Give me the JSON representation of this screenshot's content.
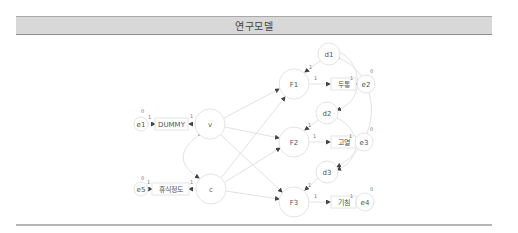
{
  "header": {
    "title": "연구모델"
  },
  "diagram": {
    "latent_nodes": [
      {
        "id": "v",
        "label": "v"
      },
      {
        "id": "c",
        "label": "c"
      },
      {
        "id": "F1",
        "label": "F1"
      },
      {
        "id": "F2",
        "label": "F2"
      },
      {
        "id": "F3",
        "label": "F3"
      }
    ],
    "disturbance_nodes": [
      {
        "id": "d1",
        "label": "d1"
      },
      {
        "id": "d2",
        "label": "d2"
      },
      {
        "id": "d3",
        "label": "d3"
      }
    ],
    "error_nodes": [
      {
        "id": "e1",
        "label": "e1",
        "variance": "0",
        "path_weight": "1"
      },
      {
        "id": "e5",
        "label": "e5",
        "variance": "0",
        "path_weight": "1"
      },
      {
        "id": "e2",
        "label": "e2",
        "variance": "0",
        "path_weight": "1"
      },
      {
        "id": "e3",
        "label": "e3",
        "variance": "0",
        "path_weight": "1"
      },
      {
        "id": "e4",
        "label": "e4",
        "variance": "0",
        "path_weight": "1"
      }
    ],
    "observed_nodes": [
      {
        "id": "dummy",
        "label": "DUMMY",
        "loading": "1"
      },
      {
        "id": "rest",
        "label": "휴식정도",
        "loading": "1"
      },
      {
        "id": "headache",
        "label": "두통",
        "loading": "1"
      },
      {
        "id": "fever",
        "label": "고열",
        "loading": "1"
      },
      {
        "id": "cough",
        "label": "기침",
        "loading": "1"
      }
    ],
    "disturbance_weights": [
      "1",
      "1",
      "1"
    ]
  }
}
